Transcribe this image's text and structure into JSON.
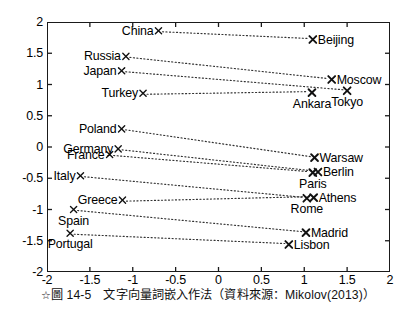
{
  "caption": {
    "marker": "☆",
    "text": "圖 14-5　文字向量詞嵌入作法（資料來源：Mikolov(2013)）"
  },
  "chart_data": {
    "type": "scatter",
    "title": "",
    "xlabel": "",
    "ylabel": "",
    "xlim": [
      -2,
      2
    ],
    "ylim": [
      -2,
      2
    ],
    "grid": false,
    "legend": null,
    "xticks": [
      "-2",
      "-1.5",
      "-1",
      "-0.5",
      "0",
      "0.5",
      "1",
      "1.5",
      "2"
    ],
    "xtick_values": [
      -2,
      -1.5,
      -1,
      -0.5,
      0,
      0.5,
      1,
      1.5,
      2
    ],
    "yticks": [
      "2",
      "1.5",
      "1",
      "0.5",
      "0",
      "-0.5",
      "-1",
      "-1.5",
      "-2"
    ],
    "ytick_values": [
      2,
      1.5,
      1,
      0.5,
      0,
      -0.5,
      -1,
      -1.5,
      -2
    ],
    "marker_style": "x",
    "line_style": "dotted",
    "pairs": [
      {
        "country": "China",
        "capital": "Beijing",
        "country_xy": [
          -0.7,
          1.86
        ],
        "capital_xy": [
          1.1,
          1.72
        ],
        "country_label_pos": "left",
        "capital_label_pos": "right"
      },
      {
        "country": "Russia",
        "capital": "Moscow",
        "country_xy": [
          -1.08,
          1.45
        ],
        "capital_xy": [
          1.32,
          1.08
        ],
        "country_label_pos": "left",
        "capital_label_pos": "right"
      },
      {
        "country": "Japan",
        "capital": "Tokyo",
        "country_xy": [
          -1.13,
          1.22
        ],
        "capital_xy": [
          1.5,
          0.9
        ],
        "country_label_pos": "left",
        "capital_label_pos": "below"
      },
      {
        "country": "Turkey",
        "capital": "Ankara",
        "country_xy": [
          -0.88,
          0.86
        ],
        "capital_xy": [
          1.09,
          0.87
        ],
        "country_label_pos": "left",
        "capital_label_pos": "below"
      },
      {
        "country": "Poland",
        "capital": "Warsaw",
        "country_xy": [
          -1.13,
          0.29
        ],
        "capital_xy": [
          1.12,
          -0.17
        ],
        "country_label_pos": "left",
        "capital_label_pos": "right"
      },
      {
        "country": "Germany",
        "capital": "Berlin",
        "country_xy": [
          -1.17,
          -0.03
        ],
        "capital_xy": [
          1.16,
          -0.4
        ],
        "country_label_pos": "left",
        "capital_label_pos": "right"
      },
      {
        "country": "France",
        "capital": "Paris",
        "country_xy": [
          -1.27,
          -0.12
        ],
        "capital_xy": [
          1.1,
          -0.41
        ],
        "country_label_pos": "left",
        "capital_label_pos": "below"
      },
      {
        "country": "Italy",
        "capital": "Rome",
        "country_xy": [
          -1.61,
          -0.46
        ],
        "capital_xy": [
          1.03,
          -0.82
        ],
        "country_label_pos": "left",
        "capital_label_pos": "below"
      },
      {
        "country": "Greece",
        "capital": "Athens",
        "country_xy": [
          -1.12,
          -0.85
        ],
        "capital_xy": [
          1.11,
          -0.81
        ],
        "country_label_pos": "left",
        "capital_label_pos": "right"
      },
      {
        "country": "Spain",
        "capital": "Madrid",
        "country_xy": [
          -1.69,
          -1.0
        ],
        "capital_xy": [
          1.02,
          -1.37
        ],
        "country_label_pos": "below",
        "capital_label_pos": "right"
      },
      {
        "country": "Portugal",
        "capital": "Lisbon",
        "country_xy": [
          -1.73,
          -1.38
        ],
        "capital_xy": [
          0.82,
          -1.56
        ],
        "country_label_pos": "below",
        "capital_label_pos": "right"
      }
    ],
    "colors": {
      "marker": "#111111",
      "line": "#333333",
      "axis": "#1a1a1a",
      "background": "#ffffff"
    }
  }
}
